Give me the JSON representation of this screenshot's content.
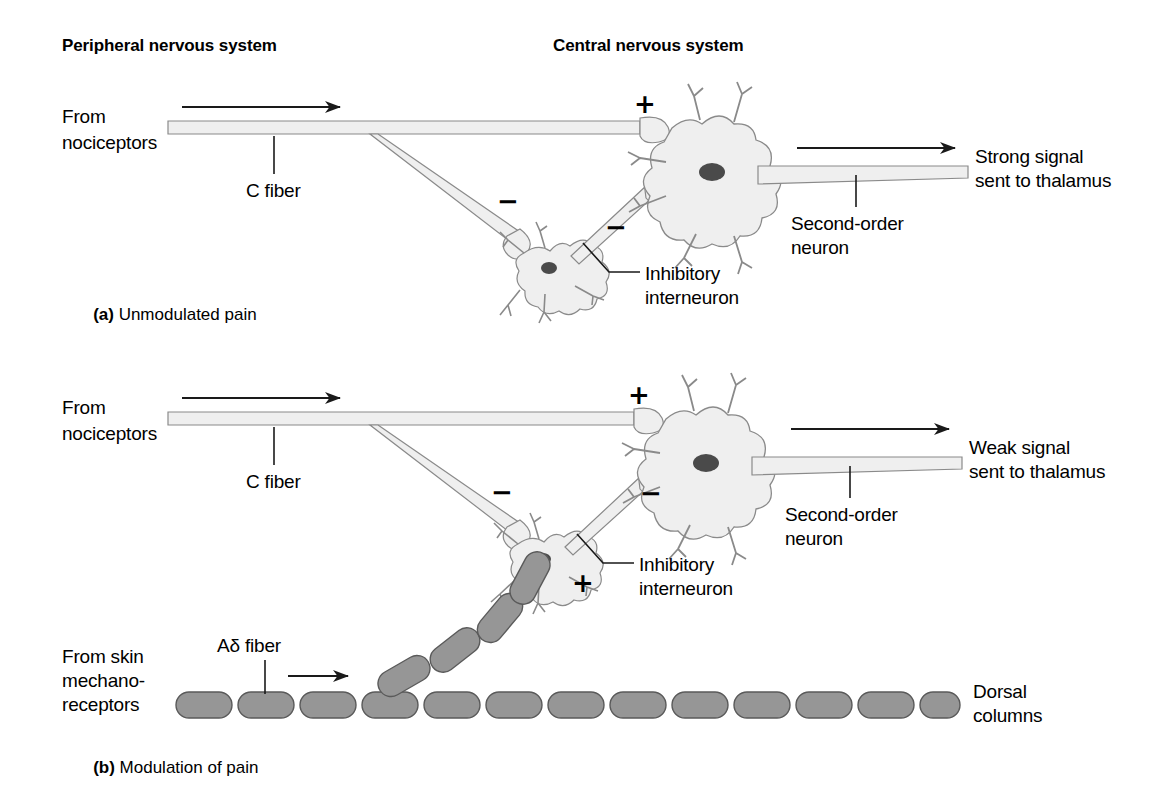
{
  "figure": {
    "title_peripheral": "Peripheral nervous system",
    "title_central": "Central nervous system"
  },
  "panel_a": {
    "caption_tag": "(a)",
    "caption_text": "Unmodulated pain",
    "from_nociceptors_line1": "From",
    "from_nociceptors_line2": "nociceptors",
    "c_fiber": "C fiber",
    "plus_sign": "+",
    "minus_sign_1": "−",
    "minus_sign_2": "−",
    "inhibitory_line1": "Inhibitory",
    "inhibitory_line2": "interneuron",
    "second_order_line1": "Second-order",
    "second_order_line2": "neuron",
    "output_line1": "Strong signal",
    "output_line2": "sent to thalamus"
  },
  "panel_b": {
    "caption_tag": "(b)",
    "caption_text": "Modulation of pain",
    "from_nociceptors_line1": "From",
    "from_nociceptors_line2": "nociceptors",
    "c_fiber": "C fiber",
    "plus_sign_top": "+",
    "plus_sign_bottom": "+",
    "minus_sign_1": "−",
    "minus_sign_2": "−",
    "inhibitory_line1": "Inhibitory",
    "inhibitory_line2": "interneuron",
    "second_order_line1": "Second-order",
    "second_order_line2": "neuron",
    "output_line1": "Weak signal",
    "output_line2": "sent to thalamus",
    "a_delta_fiber": "Aδ fiber",
    "from_skin_line1": "From skin",
    "from_skin_line2": "mechano-",
    "from_skin_line3": "receptors",
    "dorsal_line1": "Dorsal",
    "dorsal_line2": "columns"
  },
  "colors": {
    "background": "#ffffff",
    "text": "#000000",
    "neuron_fill": "#efefef",
    "neuron_stroke": "#8a8a8a",
    "nucleus": "#4a4a4a",
    "myelin_fill": "#969696",
    "myelin_stroke": "#5a5a5a",
    "arrow": "#1a1a1a"
  }
}
